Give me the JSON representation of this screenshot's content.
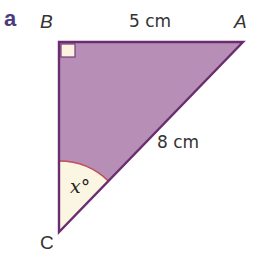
{
  "question": {
    "part_label": "a"
  },
  "triangle": {
    "vertices": {
      "A": "A",
      "B": "B",
      "C": "C"
    },
    "sides": {
      "BA": "5 cm",
      "AC": "8 cm"
    },
    "angle_C": "x°",
    "right_angle_at": "B"
  },
  "colors": {
    "fill": "#b78fb6",
    "stroke": "#6b2d6f",
    "angle_fill": "#fbf6e1",
    "angle_arc": "#c0505b",
    "right_angle_fill": "#fbf3e0",
    "part_label": "#4b3c7e",
    "text": "#333333"
  }
}
